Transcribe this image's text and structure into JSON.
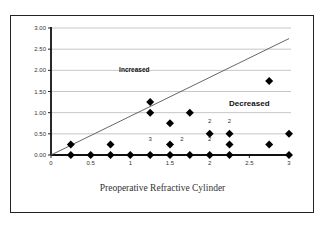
{
  "chart_data": {
    "type": "scatter",
    "title": "",
    "xlabel": "Preoperative Refractive Cylinder",
    "ylabel": "",
    "xlim": [
      0,
      3
    ],
    "ylim": [
      0,
      3
    ],
    "x_ticks": [
      "0",
      "0.5",
      "1",
      "1.5",
      "2",
      "2.5",
      "3"
    ],
    "y_ticks": [
      "0.00",
      "0.50",
      "1.00",
      "1.50",
      "2.00",
      "2.50",
      "3.00"
    ],
    "grid": "horizontal",
    "legend": null,
    "series": [
      {
        "name": "points",
        "marker": "diamond",
        "points": [
          [
            0.25,
            0
          ],
          [
            0.5,
            0
          ],
          [
            0.75,
            0
          ],
          [
            1.0,
            0
          ],
          [
            1.25,
            0
          ],
          [
            1.5,
            0
          ],
          [
            1.75,
            0
          ],
          [
            2.0,
            0
          ],
          [
            2.25,
            0
          ],
          [
            3.0,
            0
          ],
          [
            0.25,
            0.25
          ],
          [
            0.75,
            0.25
          ],
          [
            1.5,
            0.25
          ],
          [
            2.25,
            0.25
          ],
          [
            2.75,
            0.25
          ],
          [
            2.0,
            0.5
          ],
          [
            2.25,
            0.5
          ],
          [
            3.0,
            0.5
          ],
          [
            1.5,
            0.75
          ],
          [
            1.25,
            1.0
          ],
          [
            1.75,
            1.0
          ],
          [
            1.25,
            1.25
          ],
          [
            2.75,
            1.75
          ]
        ]
      }
    ],
    "reference_line": {
      "from": [
        0,
        0
      ],
      "to": [
        3,
        2.75
      ]
    },
    "annotations": [
      {
        "text": "Increased",
        "x": 1.05,
        "y": 1.95
      },
      {
        "text": "Decreased",
        "x": 2.5,
        "y": 1.15
      },
      {
        "text": "3",
        "x": 1.25,
        "y": 0.32
      },
      {
        "text": "2",
        "x": 1.65,
        "y": 0.32
      },
      {
        "text": "2",
        "x": 2.0,
        "y": 0.32
      },
      {
        "text": "2",
        "x": 2.0,
        "y": 0.75
      },
      {
        "text": "2",
        "x": 2.25,
        "y": 0.75
      }
    ]
  },
  "labels": {
    "xlabel": "Preoperative Refractive Cylinder",
    "increased": "Increased",
    "decreased": "Decreased"
  }
}
